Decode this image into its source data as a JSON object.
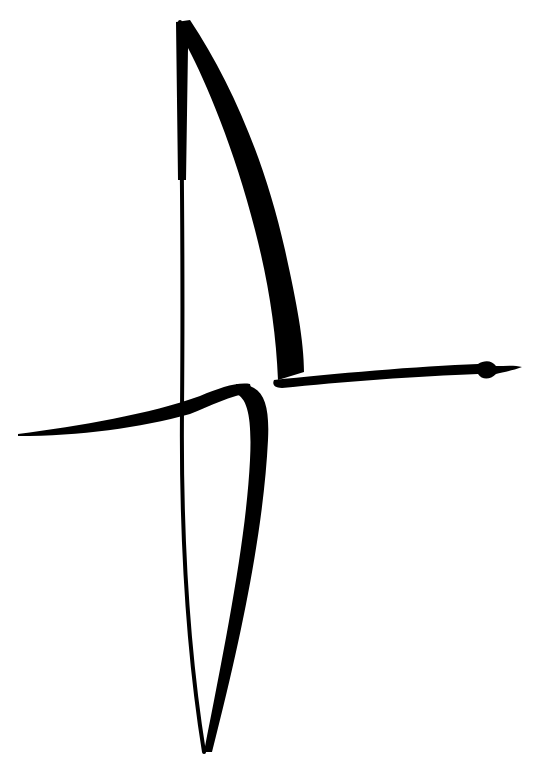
{
  "image": {
    "subject": "brush-stroke ink drawing",
    "background_color": "#ffffff",
    "ink_color": "#000000",
    "strokes": [
      "tall-left-vertical-thin",
      "upper-right-curved-sail",
      "right-horizontal-arm",
      "left-horizontal-arm",
      "lower-loop"
    ]
  }
}
